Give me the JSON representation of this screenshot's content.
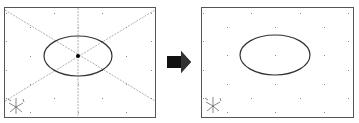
{
  "diagram": {
    "colors": {
      "frame": "#555555",
      "ellipse": "#333333",
      "grid_dot": "#888888",
      "construction_line": "#9a9a9a",
      "center_point": "#000000",
      "arrow": "#111111"
    },
    "left_panel": {
      "label": "before",
      "frame": {
        "x": 4,
        "y": 7,
        "w": 151,
        "h": 110
      },
      "ellipse": {
        "cx": 78,
        "cy": 56,
        "rx": 34,
        "ry": 20
      },
      "center_point": true,
      "construction_lines": [
        "diagonal-tl-br",
        "diagonal-bl-tr",
        "vertical-center"
      ]
    },
    "right_panel": {
      "label": "after",
      "frame": {
        "x": 201,
        "y": 7,
        "w": 152,
        "h": 110
      },
      "ellipse": {
        "cx": 275,
        "cy": 55,
        "rx": 35,
        "ry": 20
      },
      "center_point": false,
      "construction_lines": []
    },
    "arrow": {
      "direction": "right",
      "x": 167,
      "y": 52,
      "w": 24,
      "h": 22
    },
    "axis_tripod_icon": "xyz-axes-icon"
  }
}
